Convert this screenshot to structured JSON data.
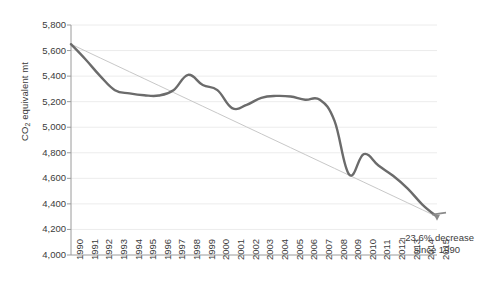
{
  "chart_data": {
    "type": "line",
    "title": "",
    "xlabel": "",
    "ylabel": "CO2 equivalent mt",
    "ylabel_prefix": "CO",
    "ylabel_sub": "2",
    "ylabel_suffix": " equivalent mt",
    "ylim": [
      4000,
      5800
    ],
    "xlim": [
      1990,
      2015
    ],
    "grid": "horizontal",
    "legend": "none",
    "categories": [
      "1990",
      "1991",
      "1992",
      "1993",
      "1994",
      "1995",
      "1996",
      "1997",
      "1998",
      "1999",
      "2000",
      "2001",
      "2002",
      "2003",
      "2004",
      "2005",
      "2006",
      "2007",
      "2008",
      "2009",
      "2010",
      "2011",
      "2012",
      "2013",
      "2014",
      "2015"
    ],
    "ytick_labels": [
      "5,800",
      "5,600",
      "5,400",
      "5,200",
      "5,000",
      "4,800",
      "4,600",
      "4,400",
      "4,200",
      "4,000"
    ],
    "ytick_values": [
      5800,
      5600,
      5400,
      5200,
      5000,
      4800,
      4600,
      4400,
      4200,
      4000
    ],
    "series": [
      {
        "name": "CO2 equivalent emissions",
        "color": "#6b6b6b",
        "values": [
          5650,
          5530,
          5400,
          5290,
          5265,
          5250,
          5248,
          5290,
          5410,
          5330,
          5290,
          5150,
          5175,
          5230,
          5245,
          5240,
          5215,
          5215,
          5050,
          4630,
          4790,
          4700,
          4620,
          4520,
          4395,
          4300
        ]
      },
      {
        "name": "Trend 1990-2015",
        "color": "#c8c8c8",
        "values": [
          5650,
          5596,
          5542,
          5488,
          5434,
          5380,
          5326,
          5272,
          5218,
          5164,
          5110,
          5056,
          5002,
          4948,
          4894,
          4840,
          4786,
          4732,
          4678,
          4624,
          4570,
          4516,
          4462,
          4408,
          4354,
          4300
        ]
      }
    ],
    "annotations": [
      {
        "line1": "–23.6% decrease",
        "line2": "since 1990"
      }
    ],
    "marker": {
      "name": "endpoint-arrow-marker",
      "at_year": "2015",
      "value": 4300,
      "color": "#8a8a8a"
    },
    "colors": {
      "series_line": "#6b6b6b",
      "trend_line": "#c8c8c8",
      "grid": "#ececec",
      "axis": "#9a9a9a",
      "text": "#3b3b3b"
    }
  }
}
